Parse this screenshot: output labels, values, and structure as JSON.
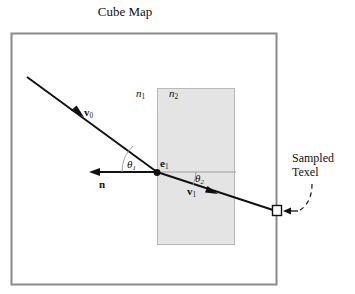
{
  "figure": {
    "title": "Cube Map",
    "labels": {
      "n1": "n",
      "n1_sub": "1",
      "n2": "n",
      "n2_sub": "2",
      "e1": "e",
      "e1_sub": "1",
      "v0": "v",
      "v0_sub": "0",
      "v1": "v",
      "v1_sub": "1",
      "normal": "n",
      "theta1": "θ",
      "theta1_sub": "1",
      "theta2": "θ",
      "theta2_sub": "2",
      "sampled": "Sampled",
      "texel": "Texel"
    },
    "colors": {
      "frame_stroke": "#8a8a8a",
      "medium_fill": "#e4e4e4",
      "medium_stroke": "#b4b4b4",
      "ray_stroke": "#111111",
      "guide_stroke": "#9a9a9a",
      "background": "#ffffff",
      "text": "#111111"
    },
    "geometry": {
      "cube_map_rect": [
        11,
        33,
        266,
        252
      ],
      "medium_rect": [
        157,
        88,
        78,
        157
      ],
      "intersection_point": [
        157,
        172
      ],
      "incident_ray_start": [
        27,
        77
      ],
      "incident_ray_arrow": [
        79,
        114
      ],
      "refracted_ray_arrow": [
        213,
        192
      ],
      "normal_arrow_tip": [
        92,
        172
      ],
      "texel_square": [
        272,
        205,
        10,
        11
      ]
    }
  }
}
